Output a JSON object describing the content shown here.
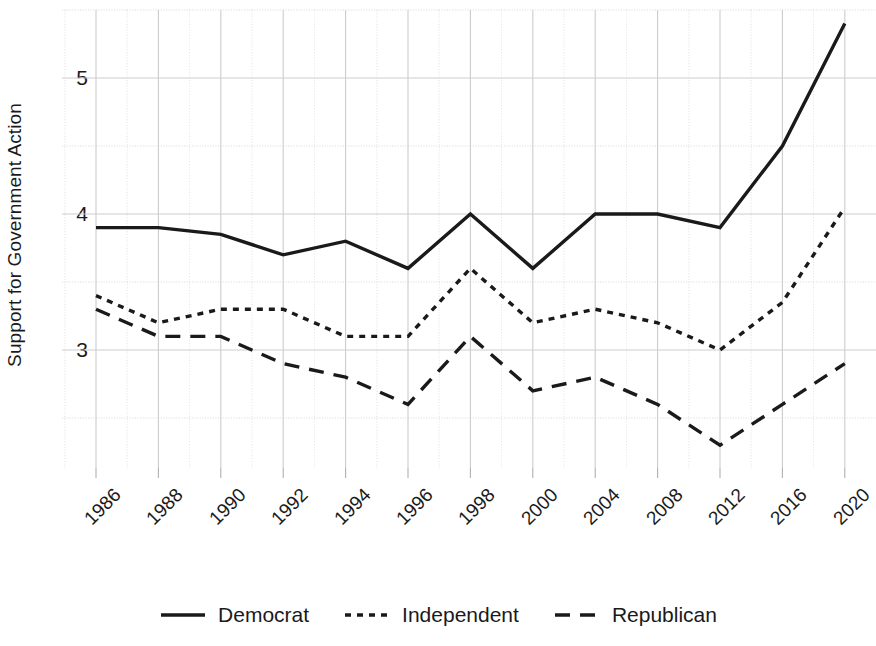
{
  "chart_data": {
    "type": "line",
    "title": "",
    "subtitle": "",
    "xlabel": "",
    "ylabel": "Support for Government Action",
    "categories": [
      "1986",
      "1988",
      "1990",
      "1992",
      "1994",
      "1996",
      "1998",
      "2000",
      "2004",
      "2008",
      "2012",
      "2016",
      "2020"
    ],
    "x_tick_rotation": -45,
    "ylim": [
      2.1,
      5.55
    ],
    "yticks": [
      3,
      4,
      5
    ],
    "ytick_labels": [
      "3",
      "4",
      "5"
    ],
    "y_minor_gridlines": [
      2.5,
      3.5,
      4.5,
      5.5
    ],
    "grid": true,
    "grid_color": "#cccccc",
    "legend_position": "bottom-center",
    "series": [
      {
        "name": "Democrat",
        "style": "solid",
        "color": "#1a1a1a",
        "values": [
          3.9,
          3.9,
          3.85,
          3.7,
          3.8,
          3.6,
          4.0,
          3.6,
          4.0,
          4.0,
          3.9,
          4.5,
          5.4
        ]
      },
      {
        "name": "Independent",
        "style": "dotted",
        "color": "#1a1a1a",
        "values": [
          3.4,
          3.2,
          3.3,
          3.3,
          3.1,
          3.1,
          3.6,
          3.2,
          3.3,
          3.2,
          3.0,
          3.35,
          4.05
        ]
      },
      {
        "name": "Republican",
        "style": "dashed",
        "color": "#1a1a1a",
        "values": [
          3.3,
          3.1,
          3.1,
          2.9,
          2.8,
          2.6,
          3.1,
          2.7,
          2.8,
          2.6,
          2.3,
          2.6,
          2.9
        ]
      }
    ]
  },
  "legend": {
    "items": [
      {
        "label": "Democrat",
        "style": "solid"
      },
      {
        "label": "Independent",
        "style": "dotted"
      },
      {
        "label": "Republican",
        "style": "dashed"
      }
    ]
  }
}
